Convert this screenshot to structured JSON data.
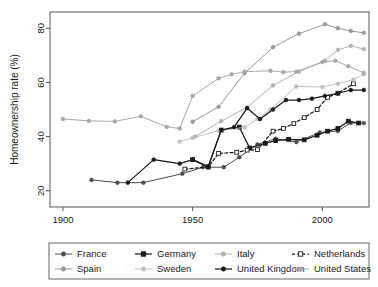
{
  "chart_data": {
    "type": "line",
    "title": "",
    "xlabel": "",
    "ylabel": "Homeownership rate (%)",
    "xlim": [
      1895,
      2018
    ],
    "ylim": [
      14,
      86
    ],
    "xticks": [
      1900,
      1950,
      2000
    ],
    "yticks": [
      20,
      40,
      60,
      80
    ],
    "xtick_labels": [
      "1900",
      "1950",
      "2000"
    ],
    "ytick_labels": [
      "20",
      "40",
      "60",
      "80"
    ],
    "grid": false,
    "legend_position": "below",
    "series": [
      {
        "name": "France",
        "color": "#4d4d4d",
        "dash": "none",
        "marker": "filled-circle",
        "x": [
          1911,
          1921,
          1931,
          1946,
          1954,
          1962,
          1968,
          1975,
          1982,
          1990,
          1999,
          2006,
          2011,
          2016
        ],
        "y": [
          24.0,
          23.0,
          23.0,
          26.3,
          28.7,
          28.7,
          32.4,
          37.1,
          39.2,
          38.0,
          41.5,
          42.1,
          45.1,
          45.0
        ]
      },
      {
        "name": "Germany",
        "color": "#1a1a1a",
        "dash": "none",
        "marker": "filled-square",
        "x": [
          1950,
          1956,
          1961,
          1968,
          1972,
          1978,
          1982,
          1987,
          1993,
          1998,
          2002,
          2006,
          2010,
          2014
        ],
        "y": [
          31.5,
          28.8,
          42.4,
          43.5,
          35.8,
          37.5,
          38.5,
          39.0,
          38.8,
          40.5,
          42.0,
          43.0,
          45.7,
          45.0
        ]
      },
      {
        "name": "Italy",
        "color": "#b3b3b3",
        "dash": "none",
        "marker": "filled-circle",
        "x": [
          1951,
          1961,
          1971,
          1981,
          1991,
          2001,
          2006,
          2011,
          2016
        ],
        "y": [
          40.0,
          45.7,
          50.8,
          58.9,
          64.0,
          68.0,
          72.0,
          73.5,
          72.3
        ]
      },
      {
        "name": "Netherlands",
        "color": "#1a1a1a",
        "dash": "dashed",
        "marker": "open-square",
        "x": [
          1947,
          1956,
          1960,
          1967,
          1971,
          1975,
          1981,
          1985,
          1989,
          1993,
          1998,
          2002,
          2006,
          2012
        ],
        "y": [
          28.0,
          28.8,
          33.8,
          34.2,
          35.0,
          35.2,
          42.0,
          43.0,
          44.8,
          47.0,
          50.0,
          54.5,
          56.0,
          59.5
        ]
      },
      {
        "name": "Spain",
        "color": "#999999",
        "dash": "none",
        "marker": "filled-circle",
        "x": [
          1950,
          1960,
          1970,
          1981,
          1991,
          2001,
          2006,
          2011,
          2016
        ],
        "y": [
          45.5,
          51.0,
          63.4,
          73.0,
          78.0,
          81.5,
          80.0,
          79.0,
          78.3
        ]
      },
      {
        "name": "Sweden",
        "color": "#c0c0c0",
        "dash": "none",
        "marker": "filled-circle",
        "x": [
          1945,
          1950,
          1960,
          1970,
          1975,
          1980,
          1990,
          2000,
          2006,
          2012,
          2016
        ],
        "y": [
          38.2,
          39.5,
          42.2,
          43.4,
          46.5,
          50.0,
          58.5,
          58.3,
          59.5,
          61.0,
          63.0
        ]
      },
      {
        "name": "United Kingdom",
        "color": "#1a1a1a",
        "dash": "none",
        "marker": "filled-circle",
        "x": [
          1925,
          1935,
          1945,
          1950,
          1956,
          1961,
          1966,
          1971,
          1976,
          1981,
          1986,
          1991,
          1996,
          2001,
          2006,
          2011,
          2016
        ],
        "y": [
          23.0,
          31.5,
          30.0,
          31.5,
          28.8,
          42.4,
          43.5,
          50.5,
          46.5,
          50.0,
          53.5,
          53.5,
          54.0,
          55.0,
          56.0,
          57.2,
          57.2
        ]
      },
      {
        "name": "United States",
        "color": "#a8a8a8",
        "dash": "none",
        "marker": "filled-circle",
        "x": [
          1900,
          1910,
          1920,
          1930,
          1940,
          1945,
          1950,
          1960,
          1965,
          1970,
          1980,
          1985,
          1990,
          2000,
          2005,
          2010,
          2016
        ],
        "y": [
          46.5,
          45.8,
          45.6,
          47.5,
          43.6,
          43.0,
          55.0,
          61.5,
          63.0,
          64.0,
          64.3,
          63.8,
          64.0,
          67.5,
          68.0,
          66.0,
          63.5
        ]
      }
    ]
  },
  "legend": {
    "entries": [
      {
        "label": "France",
        "key": "France"
      },
      {
        "label": "Germany",
        "key": "Germany"
      },
      {
        "label": "Italy",
        "key": "Italy"
      },
      {
        "label": "Netherlands",
        "key": "Netherlands"
      },
      {
        "label": "Spain",
        "key": "Spain"
      },
      {
        "label": "Sweden",
        "key": "Sweden"
      },
      {
        "label": "United Kingdom",
        "key": "United Kingdom"
      },
      {
        "label": "United States",
        "key": "United States"
      }
    ]
  }
}
